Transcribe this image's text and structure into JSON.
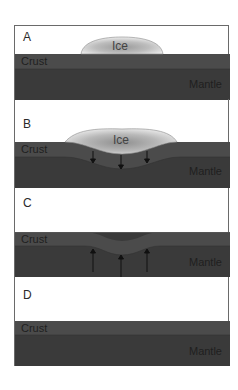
{
  "diagram": {
    "type": "isostatic-rebound-sequence",
    "colors": {
      "crust": "#4b4b4b",
      "mantle": "#3a3a3a",
      "ice_light": "#e8e8e8",
      "ice_dark": "#9a9a9a",
      "frame": "#6a6a6a",
      "background": "#ffffff"
    },
    "panels": [
      {
        "id": "A",
        "label": "A",
        "crust_label": "Crust",
        "mantle_label": "Mantle",
        "ice_label": "Ice",
        "state": "ice on flat crust"
      },
      {
        "id": "B",
        "label": "B",
        "crust_label": "Crust",
        "mantle_label": "Mantle",
        "ice_label": "Ice",
        "state": "crust depressed by ice",
        "arrows": "down"
      },
      {
        "id": "C",
        "label": "C",
        "crust_label": "Crust",
        "mantle_label": "Mantle",
        "state": "ice gone, crust rebounding",
        "arrows": "up"
      },
      {
        "id": "D",
        "label": "D",
        "crust_label": "Crust",
        "mantle_label": "Mantle",
        "state": "crust restored flat"
      }
    ]
  }
}
